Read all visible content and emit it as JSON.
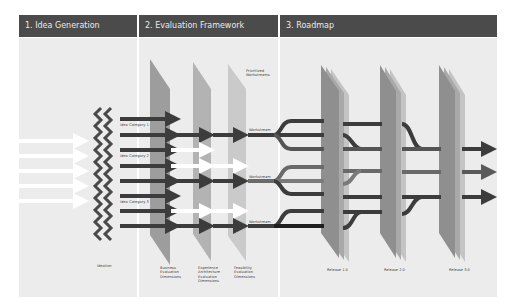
{
  "sections": [
    {
      "title": "1. Idea Generation"
    },
    {
      "title": "2. Evaluation Framework"
    },
    {
      "title": "3. Roadmap"
    }
  ],
  "idea_generation": {
    "categories": [
      "Idea Category 1",
      "Idea Category 2",
      "Idea Category 3"
    ],
    "ideation_label": "Ideation"
  },
  "evaluation": {
    "prioritized_label": "Prioritized\nWorkstreams",
    "dimensions": [
      "Business\nEvaluation\nDimensions",
      "Experience\nArchitecture\nEvaluation\nDimensions",
      "Feasibility\nEvaluation\nDimensions"
    ],
    "workstream_labels": [
      "Workstream",
      "Workstream",
      "Workstream"
    ]
  },
  "roadmap": {
    "releases": [
      "Release 1.0",
      "Release 2.0",
      "Release 3.0"
    ]
  },
  "colors": {
    "header_bg": "#4b4b4b",
    "panel_bg": "#ececec",
    "arrow_dark": "#3c3c3c",
    "arrow_light": "#ffffff",
    "plane_dark": "#8f8f8f",
    "plane_mid": "#a9a9a9",
    "plane_light": "#c4c4c4"
  }
}
